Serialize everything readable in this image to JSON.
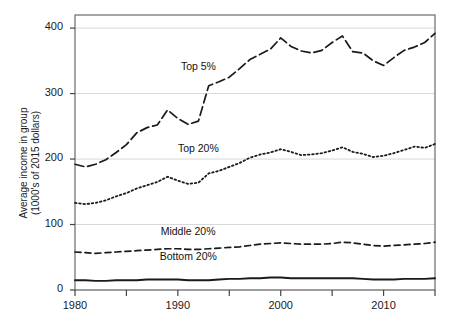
{
  "chart_data": {
    "type": "line",
    "title": "",
    "xlabel": "",
    "ylabel": "Average income in group\n(1000's of 2015 dollars)",
    "xlim": [
      1980,
      2015
    ],
    "ylim": [
      0,
      420
    ],
    "grid": true,
    "legend_position": "inline-labels",
    "xticks": [
      1980,
      1990,
      2000,
      2010
    ],
    "yticks": [
      0,
      100,
      200,
      300,
      400
    ],
    "gridlines": [
      0,
      100,
      200,
      300,
      400
    ],
    "x": [
      1980,
      1981,
      1982,
      1983,
      1984,
      1985,
      1986,
      1987,
      1988,
      1989,
      1990,
      1991,
      1992,
      1993,
      1994,
      1995,
      1996,
      1997,
      1998,
      1999,
      2000,
      2001,
      2002,
      2003,
      2004,
      2005,
      2006,
      2007,
      2008,
      2009,
      2010,
      2011,
      2012,
      2013,
      2014,
      2015
    ],
    "series": [
      {
        "name": "Top 5%",
        "style": "long-dash",
        "values": [
          192,
          188,
          192,
          199,
          210,
          222,
          240,
          248,
          252,
          275,
          262,
          253,
          258,
          312,
          318,
          325,
          338,
          352,
          360,
          368,
          385,
          372,
          365,
          362,
          366,
          378,
          388,
          364,
          362,
          350,
          343,
          355,
          366,
          371,
          378,
          392
        ]
      },
      {
        "name": "Top 20%",
        "style": "dotted",
        "values": [
          133,
          131,
          133,
          137,
          143,
          148,
          155,
          160,
          165,
          173,
          167,
          162,
          164,
          178,
          182,
          188,
          194,
          202,
          207,
          210,
          215,
          211,
          206,
          207,
          209,
          213,
          218,
          211,
          208,
          203,
          205,
          209,
          214,
          219,
          217,
          223
        ]
      },
      {
        "name": "Middle 20%",
        "style": "dashed",
        "values": [
          58,
          57,
          56,
          57,
          58,
          59,
          60,
          61,
          62,
          63,
          63,
          62,
          62,
          63,
          64,
          65,
          66,
          68,
          70,
          71,
          72,
          71,
          70,
          70,
          70,
          71,
          73,
          72,
          70,
          68,
          67,
          68,
          69,
          70,
          71,
          73
        ]
      },
      {
        "name": "Bottom 20%",
        "style": "solid",
        "values": [
          15,
          15,
          14,
          14,
          15,
          15,
          15,
          16,
          16,
          16,
          16,
          15,
          15,
          15,
          16,
          17,
          17,
          18,
          18,
          19,
          19,
          18,
          18,
          18,
          18,
          18,
          18,
          18,
          17,
          16,
          16,
          16,
          17,
          17,
          17,
          18
        ]
      }
    ],
    "annotations": [
      {
        "text": "Top 5%",
        "x": 1992,
        "y": 340
      },
      {
        "text": "Top 20%",
        "x": 1992,
        "y": 215
      },
      {
        "text": "Middle 20%",
        "x": 1991,
        "y": 88
      },
      {
        "text": "Bottom 20%",
        "x": 1991,
        "y": 50
      }
    ],
    "colors": {
      "line": "#1a1a1a",
      "grid": "#d8d8d8",
      "axis": "#555555",
      "background": "#ffffff"
    }
  }
}
